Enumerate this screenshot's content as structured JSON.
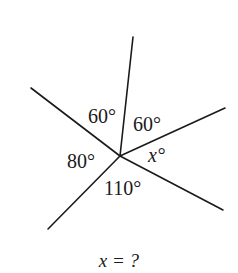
{
  "diagram": {
    "center": [
      120,
      156
    ],
    "rays": [
      {
        "name": "ray-top",
        "end": [
          133,
          37
        ]
      },
      {
        "name": "ray-upper-right",
        "end": [
          225,
          108
        ]
      },
      {
        "name": "ray-lower-right",
        "end": [
          223,
          210
        ]
      },
      {
        "name": "ray-lower-left",
        "end": [
          48,
          229
        ]
      },
      {
        "name": "ray-upper-left",
        "end": [
          31,
          88
        ]
      }
    ],
    "angles": {
      "top_left": "60°",
      "top_right": "60°",
      "right": "x°",
      "bottom": "110°",
      "left": "80°"
    },
    "line_color": "#1a1a1a"
  },
  "question": "x = ?"
}
